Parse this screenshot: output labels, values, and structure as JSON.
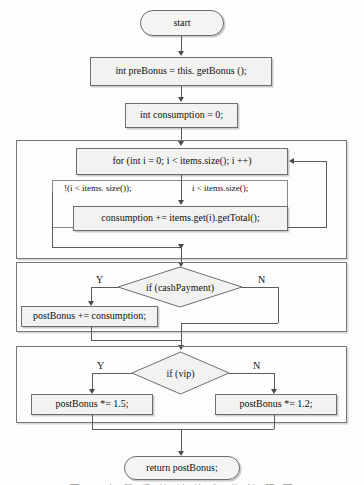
{
  "figure": {
    "type": "flowchart",
    "title": "",
    "caption": "图 一 点 餐 系 统 计 算 积 分 流 程 图",
    "caption_visible": "partially cut off at bottom edge"
  },
  "nodes": {
    "start": {
      "label": "start",
      "shape": "terminator"
    },
    "pre_bonus": {
      "label": "int preBonus = this. getBonus ();",
      "shape": "process"
    },
    "consumption_init": {
      "label": "int consumption = 0;",
      "shape": "process"
    },
    "for_loop": {
      "label": "for (int  i = 0;  i  <  items.size(); i ++)",
      "shape": "process"
    },
    "loop_body": {
      "label": "consumption += items.get(i).getTotal();",
      "shape": "process"
    },
    "if_cash": {
      "label": "if (cashPayment)",
      "shape": "decision"
    },
    "post_bonus_add": {
      "label": "postBonus += consumption;",
      "shape": "process"
    },
    "if_vip": {
      "label": "if (vip)",
      "shape": "decision"
    },
    "vip_yes": {
      "label": "postBonus *= 1.5;",
      "shape": "process"
    },
    "vip_no": {
      "label": "postBonus *= 1.2;",
      "shape": "process"
    },
    "return": {
      "label": "return postBonus;",
      "shape": "terminator"
    }
  },
  "edge_labels": {
    "loop_exit": "!(i < items. size());",
    "loop_continue": "i  <  items.size();",
    "cash_yes": "Y",
    "cash_no": "N",
    "vip_yes": "Y",
    "vip_no": "N"
  },
  "colors": {
    "node_fill": "#f2f2f0",
    "node_border": "#6e6e6e",
    "group_border": "#777777",
    "connector": "#5a5a5a",
    "text": "#111111",
    "background": "#fdfdfd"
  }
}
